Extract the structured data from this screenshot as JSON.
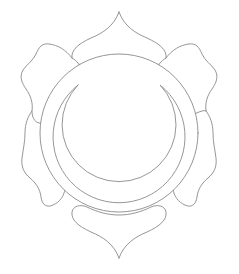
{
  "image": {
    "kind": "line-art-illustration",
    "subject": "six-petaled lotus chakra symbol with inner circle and crescent moon",
    "background_color": "#ffffff",
    "stroke_color": "#8a8a8a",
    "stroke_width": 0.9,
    "canvas": {
      "width": 239,
      "height": 274
    },
    "title": "",
    "caption": "",
    "visible_text": ""
  },
  "geometry": {
    "center": {
      "x": 119,
      "y": 133
    },
    "outer_circle": {
      "cx": 119,
      "cy": 133,
      "r": 79
    },
    "crescent": {
      "outer": {
        "cx": 119,
        "cy": 137,
        "r": 66
      },
      "inner": {
        "cx": 119,
        "cy": 146,
        "r": 57
      },
      "left_horn": {
        "x": 78,
        "y": 85
      },
      "right_horn": {
        "x": 160,
        "y": 85
      }
    },
    "petals": [
      {
        "name": "petal-top",
        "tip": {
          "x": 119,
          "y": 12
        },
        "angle_deg": 270
      },
      {
        "name": "petal-upper-right",
        "tip": {
          "x": 215,
          "y": 70
        },
        "angle_deg": 330
      },
      {
        "name": "petal-lower-right",
        "tip": {
          "x": 215,
          "y": 196
        },
        "angle_deg": 30
      },
      {
        "name": "petal-bottom",
        "tip": {
          "x": 119,
          "y": 258
        },
        "angle_deg": 90
      },
      {
        "name": "petal-lower-left",
        "tip": {
          "x": 23,
          "y": 196
        },
        "angle_deg": 150
      },
      {
        "name": "petal-upper-left",
        "tip": {
          "x": 23,
          "y": 70
        },
        "angle_deg": 210
      }
    ],
    "petal_count": 6
  }
}
